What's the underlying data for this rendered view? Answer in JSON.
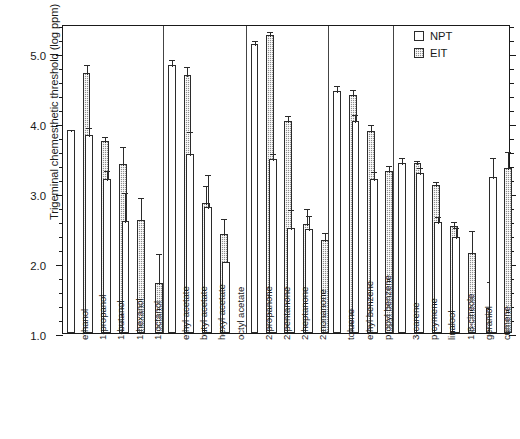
{
  "chart_data": {
    "type": "bar",
    "title": "",
    "xlabel": "",
    "ylabel": "Trigeminal chemesthetic threshold (log ppm)",
    "ylim": [
      1.0,
      5.41
    ],
    "ytick_labels": [
      "1.0",
      "2.0",
      "3.0",
      "4.0",
      "5.0"
    ],
    "ytick_values": [
      1.0,
      2.0,
      3.0,
      4.0,
      5.0
    ],
    "yminor_step": 0.2,
    "grid": false,
    "legend_position": "top-right",
    "legend": [
      {
        "name": "NPT",
        "style": "open",
        "color": "#ffffff"
      },
      {
        "name": "EIT",
        "style": "hatched",
        "color": "#8e8e8e"
      }
    ],
    "categories": [
      "ethanol",
      "1-propanol",
      "1-butanol",
      "1-hexanol",
      "1-octanol",
      "ethyl acetate",
      "butyl acetate",
      "hexyl acetate",
      "octyl acetate",
      "2-propanone",
      "2-pentanone",
      "2-heptanone",
      "2-nonanone",
      "toluene",
      "ethyl benzene",
      "propyl benzene",
      "3-carene",
      "p-cymene",
      "linalool",
      "1,8-cineole",
      "geraniol",
      "cumene"
    ],
    "groups": [
      {
        "name": "alcohols",
        "categories": [
          "ethanol",
          "1-propanol",
          "1-butanol",
          "1-hexanol",
          "1-octanol"
        ]
      },
      {
        "name": "acetates",
        "categories": [
          "ethyl acetate",
          "butyl acetate",
          "hexyl acetate",
          "octyl acetate"
        ]
      },
      {
        "name": "ketones",
        "categories": [
          "2-propanone",
          "2-pentanone",
          "2-heptanone",
          "2-nonanone"
        ]
      },
      {
        "name": "aromatics",
        "categories": [
          "toluene",
          "ethyl benzene",
          "propyl benzene"
        ]
      },
      {
        "name": "terpenes-others",
        "categories": [
          "3-carene",
          "p-cymene",
          "linalool",
          "1,8-cineole",
          "geraniol",
          "cumene"
        ]
      }
    ],
    "series": [
      {
        "name": "NPT",
        "values": [
          3.9,
          3.82,
          3.2,
          2.6,
          null,
          4.83,
          3.55,
          2.8,
          2.02,
          5.12,
          3.48,
          2.5,
          2.48,
          4.45,
          4.02,
          3.2,
          3.42,
          3.28,
          2.58,
          2.37,
          null,
          3.22
        ],
        "errors": [
          0.03,
          0.13,
          0.14,
          0.43,
          null,
          0.1,
          0.35,
          0.49,
          null,
          0.08,
          0.11,
          0.28,
          0.22,
          0.1,
          0.12,
          0.12,
          0.1,
          0.1,
          0.1,
          0.16,
          null,
          0.3
        ]
      },
      {
        "name": "EIT",
        "values": [
          4.71,
          3.74,
          3.41,
          2.62,
          1.72,
          4.68,
          2.85,
          2.41,
          null,
          5.25,
          4.03,
          2.55,
          2.33,
          4.4,
          3.88,
          3.31,
          3.42,
          3.11,
          2.53,
          2.14,
          1.35,
          3.35
        ],
        "errors": [
          0.14,
          0.09,
          0.28,
          0.33,
          0.43,
          0.14,
          0.27,
          0.25,
          null,
          0.07,
          0.1,
          0.25,
          0.12,
          0.09,
          0.11,
          0.1,
          0.07,
          0.07,
          0.08,
          0.35,
          0.4,
          0.26
        ]
      }
    ]
  }
}
